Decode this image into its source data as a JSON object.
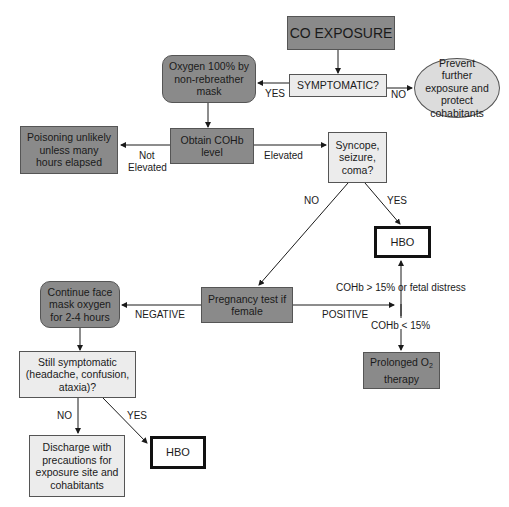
{
  "nodes": {
    "co_exposure": "CO EXPOSURE",
    "symptomatic": "SYMPTOMATIC?",
    "prevent": "Prevent further exposure and protect cohabitants",
    "oxygen": "Oxygen 100% by non-rebreather mask",
    "obtain_cohb": "Obtain COHb level",
    "poisoning_unlikely": "Poisoning unlikely unless many hours elapsed",
    "syncope": "Syncope, seizure, coma?",
    "hbo_top": "HBO",
    "pregnancy": "Pregnancy test if female",
    "continue_oxygen": "Continue face mask oxygen for 2-4 hours",
    "prolonged_o2": "Prolonged O",
    "prolonged_o2_sub": "2",
    "prolonged_o2_line2": "therapy",
    "still_symptomatic": "Still symptomatic (headache, confusion, ataxia)?",
    "discharge": "Discharge with precautions for exposure site and cohabitants",
    "hbo_bottom": "HBO"
  },
  "edge_labels": {
    "yes_oxygen": "YES",
    "no_prevent": "NO",
    "not_elevated_1": "Not",
    "not_elevated_2": "Elevated",
    "elevated": "Elevated",
    "syncope_no": "NO",
    "syncope_yes": "YES",
    "negative": "NEGATIVE",
    "positive": "POSITIVE",
    "cohb_high": "COHb > 15% or fetal distress",
    "cohb_low": "COHb < 15%",
    "still_no": "NO",
    "still_yes": "YES"
  },
  "colors": {
    "dark_fill": "#8a8a8a",
    "light_fill": "#ececec",
    "oval_fill": "#dcdcdc",
    "line": "#1a1a1a"
  }
}
